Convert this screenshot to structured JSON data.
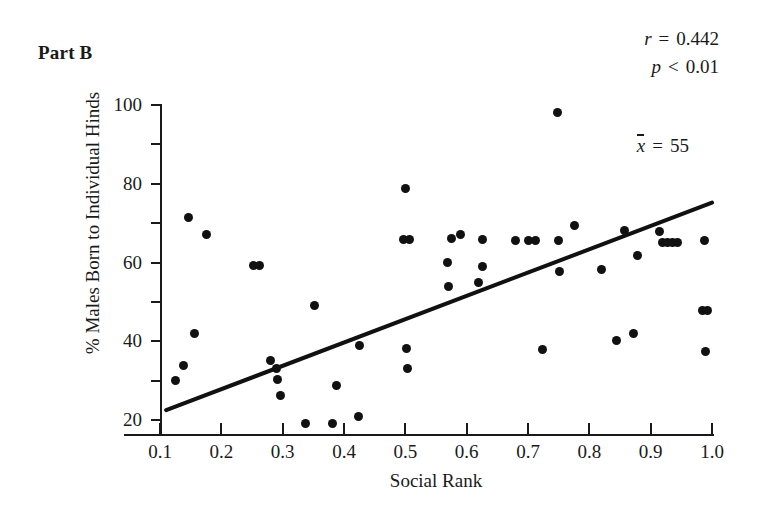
{
  "figure": {
    "part_label": "Part B",
    "background": "#ffffff",
    "ink_color": "#111111"
  },
  "annotations": {
    "r_symbol": "r",
    "r_relation": "=",
    "r_value": "0.442",
    "p_symbol": "p",
    "p_relation": "<",
    "p_value": "0.01",
    "mean_symbol": "x",
    "mean_relation": "=",
    "mean_value": "55"
  },
  "chart_data": {
    "type": "scatter",
    "title": "Part B",
    "xlabel": "Social Rank",
    "ylabel": "% Males Born to Individual Hinds",
    "xlim": [
      0.1,
      1.0
    ],
    "ylim": [
      20,
      100
    ],
    "grid": false,
    "legend": null,
    "xticks": [
      0.1,
      0.2,
      0.3,
      0.4,
      0.5,
      0.6,
      0.7,
      0.8,
      0.9,
      1.0
    ],
    "xticklabels": [
      "0.1",
      "0.2",
      "0.3",
      "0.4",
      "0.5",
      "0.6",
      "0.7",
      "0.8",
      "0.9",
      "1.0"
    ],
    "yticks_major": [
      20,
      40,
      60,
      80,
      100
    ],
    "yticklabels": [
      "20",
      "40",
      "60",
      "80",
      "100"
    ],
    "yticks_minor": [
      30,
      50,
      70,
      90
    ],
    "marker": "filled-circle",
    "points": [
      [
        0.125,
        30.0
      ],
      [
        0.139,
        33.8
      ],
      [
        0.147,
        71.5
      ],
      [
        0.157,
        42.0
      ],
      [
        0.176,
        67.2
      ],
      [
        0.253,
        59.2
      ],
      [
        0.263,
        59.2
      ],
      [
        0.28,
        35.2
      ],
      [
        0.29,
        33.2
      ],
      [
        0.292,
        30.4
      ],
      [
        0.296,
        26.2
      ],
      [
        0.337,
        19.2
      ],
      [
        0.352,
        49.0
      ],
      [
        0.382,
        19.0
      ],
      [
        0.388,
        28.8
      ],
      [
        0.424,
        21.0
      ],
      [
        0.425,
        39.0
      ],
      [
        0.497,
        65.8
      ],
      [
        0.507,
        65.8
      ],
      [
        0.5,
        78.8
      ],
      [
        0.502,
        38.2
      ],
      [
        0.503,
        33.0
      ],
      [
        0.568,
        60.0
      ],
      [
        0.57,
        54.0
      ],
      [
        0.575,
        66.0
      ],
      [
        0.59,
        67.0
      ],
      [
        0.62,
        54.8
      ],
      [
        0.625,
        59.0
      ],
      [
        0.626,
        65.8
      ],
      [
        0.68,
        65.5
      ],
      [
        0.7,
        65.6
      ],
      [
        0.712,
        65.6
      ],
      [
        0.723,
        38.0
      ],
      [
        0.748,
        98.0
      ],
      [
        0.75,
        65.5
      ],
      [
        0.752,
        57.8
      ],
      [
        0.775,
        69.5
      ],
      [
        0.82,
        58.2
      ],
      [
        0.845,
        40.2
      ],
      [
        0.858,
        68.2
      ],
      [
        0.872,
        42.0
      ],
      [
        0.878,
        61.8
      ],
      [
        0.915,
        67.8
      ],
      [
        0.92,
        65.2
      ],
      [
        0.928,
        65.0
      ],
      [
        0.936,
        65.0
      ],
      [
        0.944,
        65.0
      ],
      [
        0.985,
        47.8
      ],
      [
        0.993,
        47.8
      ],
      [
        0.988,
        65.5
      ],
      [
        0.99,
        37.5
      ]
    ],
    "trendline": {
      "type": "linear",
      "x_start": 0.11,
      "y_start": 22.5,
      "x_end": 1.0,
      "y_end": 75.2,
      "color": "#111111",
      "width": 4
    }
  }
}
